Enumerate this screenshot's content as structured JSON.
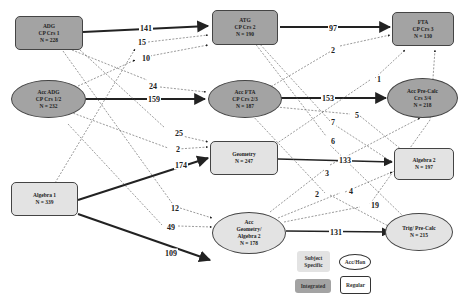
{
  "nodes": [
    {
      "id": "adg",
      "lines": [
        "ADG",
        "CP Crs 1",
        "N = 228"
      ],
      "shape": "rect",
      "type": "integrated"
    },
    {
      "id": "acc_adg",
      "lines": [
        "Acc ADG",
        "CP Crs 1/2",
        "N = 232"
      ],
      "shape": "oval",
      "type": "integrated"
    },
    {
      "id": "alg1",
      "lines": [
        "Algebra 1",
        "N = 339"
      ],
      "shape": "rect",
      "type": "subject"
    },
    {
      "id": "atg",
      "lines": [
        "ATG",
        "CP Crs 2",
        "N = 190"
      ],
      "shape": "rect",
      "type": "integrated"
    },
    {
      "id": "acc_fta",
      "lines": [
        "Acc FTA",
        "CP Crs 2/3",
        "N = 187"
      ],
      "shape": "oval",
      "type": "integrated"
    },
    {
      "id": "geometry",
      "lines": [
        "Geometry",
        "N = 247"
      ],
      "shape": "rect",
      "type": "subject"
    },
    {
      "id": "acc_geo",
      "lines": [
        "Acc",
        "Geometry/",
        "Algebra 2",
        "N = 178"
      ],
      "shape": "oval",
      "type": "subject"
    },
    {
      "id": "fta",
      "lines": [
        "FTA",
        "CP Crs 3",
        "N = 130"
      ],
      "shape": "rect",
      "type": "integrated"
    },
    {
      "id": "acc_precalc",
      "lines": [
        "Acc Pre-Calc",
        "Crs 3/4",
        "N = 218"
      ],
      "shape": "oval",
      "type": "integrated"
    },
    {
      "id": "alg2",
      "lines": [
        "Algebra 2",
        "N = 197"
      ],
      "shape": "rect",
      "type": "subject"
    },
    {
      "id": "trig",
      "lines": [
        "Trig/ Pre-Calc",
        "N = 215"
      ],
      "shape": "oval",
      "type": "subject"
    }
  ],
  "edges": [
    {
      "from": "adg",
      "to": "atg",
      "label": "141",
      "style": "solid"
    },
    {
      "from": "alg1",
      "to": "atg",
      "label": "15",
      "style": "dashed"
    },
    {
      "from": "acc_adg",
      "to": "atg",
      "label": "10",
      "style": "dashed"
    },
    {
      "from": "adg",
      "to": "acc_fta",
      "label": "24",
      "style": "dashed"
    },
    {
      "from": "acc_adg",
      "to": "acc_fta",
      "label": "159",
      "style": "solid"
    },
    {
      "from": "adg",
      "to": "geometry",
      "label": "25",
      "style": "dashed"
    },
    {
      "from": "acc_adg",
      "to": "geometry",
      "label": "2",
      "style": "dashed"
    },
    {
      "from": "alg1",
      "to": "geometry",
      "label": "174",
      "style": "solid"
    },
    {
      "from": "adg",
      "to": "acc_geo",
      "label": "12",
      "style": "dashed"
    },
    {
      "from": "acc_adg",
      "to": "acc_geo",
      "label": "49",
      "style": "dashed"
    },
    {
      "from": "alg1",
      "to": "acc_geo",
      "label": "109",
      "style": "solid"
    },
    {
      "from": "atg",
      "to": "fta",
      "label": "97",
      "style": "solid"
    },
    {
      "from": "acc_fta",
      "to": "fta",
      "label": "2",
      "style": "dashed"
    },
    {
      "from": "geometry",
      "to": "fta",
      "label": "1",
      "style": "dashed"
    },
    {
      "from": "acc_fta",
      "to": "acc_precalc",
      "label": "153",
      "style": "solid"
    },
    {
      "from": "atg",
      "to": "alg2",
      "label": "5",
      "style": "dashed"
    },
    {
      "from": "atg",
      "to": "alg2",
      "label": "7",
      "style": "dashed"
    },
    {
      "from": "atg",
      "to": "trig",
      "label": "6",
      "style": "dashed"
    },
    {
      "from": "geometry",
      "to": "alg2",
      "label": "133",
      "style": "solid"
    },
    {
      "from": "acc_geo",
      "to": "acc_precalc",
      "label": "3",
      "style": "dashed"
    },
    {
      "from": "acc_fta",
      "to": "trig",
      "label": "2",
      "style": "dashed"
    },
    {
      "from": "acc_geo",
      "to": "alg2",
      "label": "4",
      "style": "dashed"
    },
    {
      "from": "acc_geo",
      "to": "fta",
      "label": "19",
      "style": "dashed"
    },
    {
      "from": "acc_geo",
      "to": "trig",
      "label": "131",
      "style": "solid"
    }
  ],
  "legend": {
    "subject_specific": [
      "Subject",
      "Specific"
    ],
    "integrated": "Integrated",
    "acc_hon": "Acc/Hon",
    "regular": "Regular"
  },
  "colors": {
    "integrated": "#a3a3a3",
    "subject_specific": "#e3e3e3",
    "stroke": "#333333"
  }
}
